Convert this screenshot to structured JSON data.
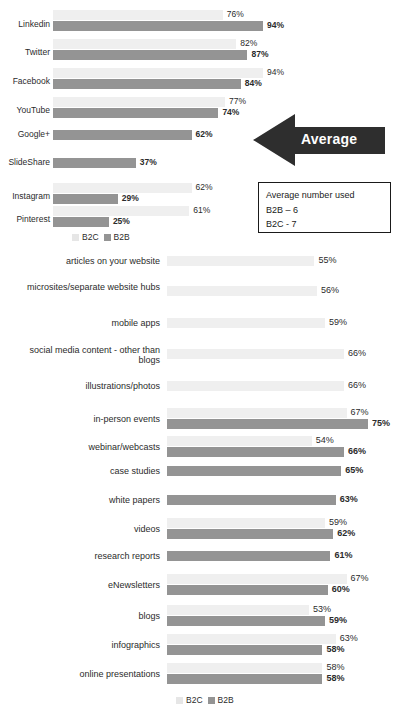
{
  "legend": {
    "b2c_label": "B2C",
    "b2b_label": "B2B"
  },
  "colors": {
    "b2c": "#efefef",
    "b2b": "#949494",
    "arrow": "#2e2e2e",
    "text": "#2b2b2b",
    "box_border": "#1a1a1a"
  },
  "callout": {
    "arrow_label": "Average",
    "box_title": "Average number used",
    "box_line_b2b": "B2B – 6",
    "box_line_b2c": "B2C - 7"
  },
  "chart_data": [
    {
      "type": "bar",
      "title": "",
      "orientation": "horizontal",
      "xlabel": "",
      "ylabel": "",
      "xlim": [
        0,
        100
      ],
      "grid": false,
      "legend_position": "bottom-left",
      "value_suffix": "%",
      "categories": [
        "Linkedin",
        "Twitter",
        "Facebook",
        "YouTube",
        "Google+",
        "SlideShare",
        "Instagram",
        "Pinterest"
      ],
      "series": [
        {
          "name": "B2C",
          "values": [
            76,
            82,
            94,
            77,
            null,
            null,
            62,
            61
          ]
        },
        {
          "name": "B2B",
          "values": [
            94,
            87,
            84,
            74,
            62,
            37,
            29,
            25
          ]
        }
      ],
      "labels": {
        "b2c": [
          "76%",
          "82%",
          "94%",
          "77%",
          "",
          "",
          "62%",
          "61%"
        ],
        "b2b": [
          "94%",
          "87%",
          "84%",
          "74%",
          "62%",
          "37%",
          "29%",
          "25%"
        ]
      }
    },
    {
      "type": "bar",
      "title": "",
      "orientation": "horizontal",
      "xlabel": "",
      "ylabel": "",
      "xlim": [
        0,
        100
      ],
      "grid": false,
      "legend_position": "bottom-center",
      "value_suffix": "%",
      "categories": [
        "articles on your website",
        "microsites/separate website hubs",
        "mobile apps",
        "social media content - other than blogs",
        "illustrations/photos",
        "in-person events",
        "webinar/webcasts",
        "case studies",
        "white papers",
        "videos",
        "research reports",
        "eNewsletters",
        "blogs",
        "infographics",
        "online presentations"
      ],
      "series": [
        {
          "name": "B2C",
          "values": [
            55,
            56,
            59,
            66,
            66,
            67,
            54,
            null,
            null,
            59,
            null,
            67,
            53,
            63,
            58
          ]
        },
        {
          "name": "B2B",
          "values": [
            null,
            null,
            null,
            null,
            null,
            75,
            66,
            65,
            63,
            62,
            61,
            60,
            59,
            58,
            58
          ]
        }
      ],
      "labels": {
        "b2c": [
          "55%",
          "56%",
          "59%",
          "66%",
          "66%",
          "67%",
          "54%",
          "",
          "",
          "59%",
          "",
          "67%",
          "53%",
          "63%",
          "58%"
        ],
        "b2b": [
          "",
          "",
          "",
          "",
          "",
          "75%",
          "66%",
          "65%",
          "63%",
          "62%",
          "61%",
          "60%",
          "59%",
          "58%",
          "58%"
        ]
      }
    }
  ]
}
